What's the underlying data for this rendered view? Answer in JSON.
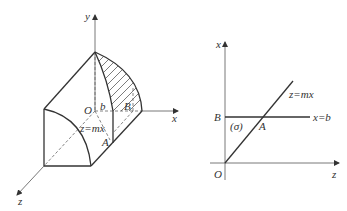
{
  "figure": {
    "left_panel": {
      "title": "3D solid with cross-section",
      "axes": {
        "x_label": "x",
        "y_label": "y",
        "z_label": "z"
      },
      "points": {
        "origin": "O",
        "b_mark": "b",
        "B": "B",
        "A": "A"
      },
      "plane_label": "z=mx"
    },
    "right_panel": {
      "title": "Projection onto xz-plane",
      "axes": {
        "vertical_label": "x",
        "horizontal_label": "z"
      },
      "points": {
        "origin": "O",
        "B": "B",
        "A": "A"
      },
      "lines": {
        "sloped": "z=mx",
        "horizontal": "x=b"
      },
      "region_label": "(σ)"
    }
  },
  "colors": {
    "stroke": "#333333",
    "background": "#ffffff"
  }
}
